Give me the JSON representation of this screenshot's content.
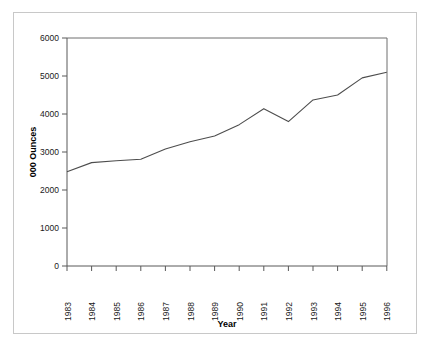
{
  "chart_data": {
    "type": "line",
    "title": "",
    "xlabel": "Year",
    "ylabel": "000 Ounces",
    "x": [
      1983,
      1984,
      1985,
      1986,
      1987,
      1988,
      1989,
      1990,
      1991,
      1992,
      1993,
      1994,
      1995,
      1996
    ],
    "categories": [
      "1983",
      "1984",
      "1985",
      "1986",
      "1987",
      "1988",
      "1989",
      "1990",
      "1991",
      "1992",
      "1993",
      "1994",
      "1995",
      "1996"
    ],
    "values": [
      2480,
      2720,
      2770,
      2810,
      3080,
      3270,
      3420,
      3720,
      4140,
      3800,
      4370,
      4500,
      4950,
      5100
    ],
    "series": [
      {
        "name": "000 Ounces",
        "values": [
          2480,
          2720,
          2770,
          2810,
          3080,
          3270,
          3420,
          3720,
          4140,
          3800,
          4370,
          4500,
          4950,
          5100
        ]
      }
    ],
    "ylim": [
      0,
      6000
    ],
    "yticks": [
      0,
      1000,
      2000,
      3000,
      4000,
      5000,
      6000
    ],
    "ytick_labels": [
      "0",
      "1000",
      "2000",
      "3000",
      "4000",
      "5000",
      "6000"
    ],
    "xtick_labels": [
      "1983",
      "1984",
      "1985",
      "1986",
      "1987",
      "1988",
      "1989",
      "1990",
      "1991",
      "1992",
      "1993",
      "1994",
      "1995",
      "1996"
    ],
    "grid": false,
    "legend": "none",
    "line_color": "#4d4d4d",
    "axis_color": "#595959",
    "frame_color": "#c8c8c8",
    "background": "#ffffff"
  }
}
